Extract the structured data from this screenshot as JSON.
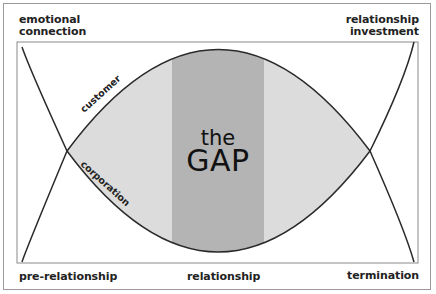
{
  "diagram": {
    "title_top": "the",
    "title_main": "GAP",
    "corner_labels": {
      "top_left": [
        "emotional",
        "connection"
      ],
      "top_right": [
        "relationship",
        "investment"
      ],
      "bottom_left": "pre-relationship",
      "bottom_middle": "relationship",
      "bottom_right": "termination"
    },
    "curves": [
      {
        "name": "customer",
        "label": "customer",
        "description": "upper arc of emotional connection"
      },
      {
        "name": "corporation",
        "label": "corporation",
        "description": "lower arc of relationship investment"
      }
    ],
    "colors": {
      "gap_light": "#dcdcdc",
      "gap_band": "#b4b4b4",
      "line": "#2a2a2a",
      "frame": "#9a9a9a"
    }
  }
}
